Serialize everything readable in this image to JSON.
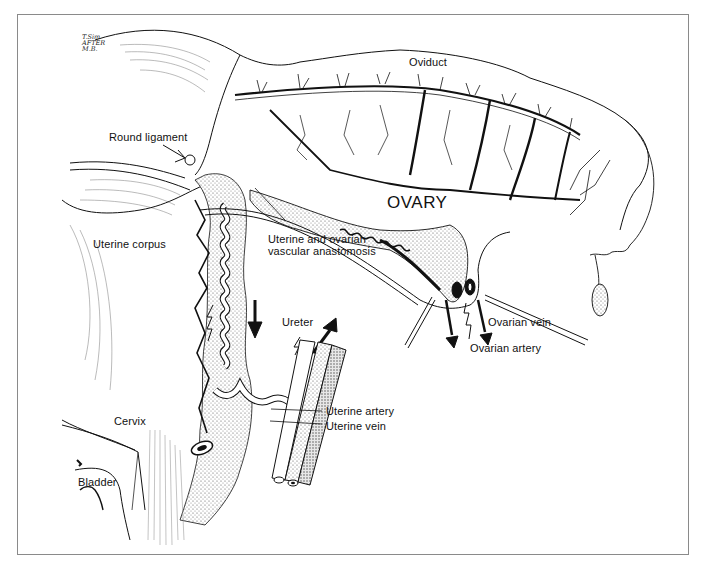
{
  "figure": {
    "signature": [
      "T.Sim",
      "AFTER",
      "M.B."
    ],
    "labels": {
      "oviduct": "Oviduct",
      "round_ligament": "Round ligament",
      "ovary": "OVARY",
      "anastomosis_line1": "Uterine and ovarian",
      "anastomosis_line2": "vascular anastomosis",
      "uterine_corpus": "Uterine corpus",
      "ureter": "Ureter",
      "ovarian_vein": "Ovarian vein",
      "ovarian_artery": "Ovarian artery",
      "cervix": "Cervix",
      "uterine_artery": "Uterine artery",
      "uterine_vein": "Uterine vein",
      "bladder": "Bladder"
    },
    "colors": {
      "ink": "#111111",
      "frame": "#8a8a8a",
      "stipple": "#9a9a9a",
      "background": "#ffffff"
    }
  }
}
